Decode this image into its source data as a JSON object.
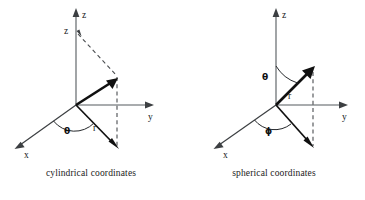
{
  "figure": {
    "type": "coordinate-system-diagram-pair",
    "background_color": "#ffffff",
    "ink_color": "#101010",
    "axis_color": "#555a5e",
    "panels": [
      {
        "id": "cylindrical",
        "caption": "cylindrical coordinates",
        "axes": [
          {
            "name": "x",
            "label": "x"
          },
          {
            "name": "y",
            "label": "y"
          },
          {
            "name": "z",
            "label": "z"
          }
        ],
        "coordinate_labels": [
          {
            "name": "height",
            "label": "z"
          },
          {
            "name": "radius",
            "label": "r"
          },
          {
            "name": "azimuth",
            "label": "θ"
          }
        ]
      },
      {
        "id": "spherical",
        "caption": "spherical coordinates",
        "axes": [
          {
            "name": "x",
            "label": "x"
          },
          {
            "name": "y",
            "label": "y"
          },
          {
            "name": "z",
            "label": "z"
          }
        ],
        "coordinate_labels": [
          {
            "name": "radius",
            "label": "r"
          },
          {
            "name": "polar",
            "label": "θ"
          },
          {
            "name": "azimuth",
            "label": "ϕ"
          }
        ]
      }
    ]
  }
}
